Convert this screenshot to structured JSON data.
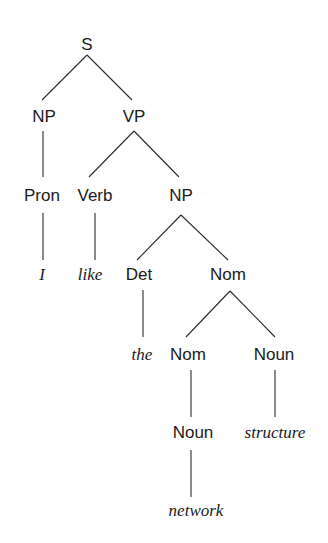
{
  "diagram": {
    "type": "parse-tree",
    "sentence": "I like the network structure",
    "nodes": [
      {
        "id": "S",
        "label": "S",
        "kind": "category",
        "x": 87,
        "y": 50
      },
      {
        "id": "NP1",
        "label": "NP",
        "kind": "category",
        "x": 44,
        "y": 122
      },
      {
        "id": "VP",
        "label": "VP",
        "kind": "category",
        "x": 134,
        "y": 122
      },
      {
        "id": "Pron",
        "label": "Pron",
        "kind": "category",
        "x": 42,
        "y": 201
      },
      {
        "id": "Verb",
        "label": "Verb",
        "kind": "category",
        "x": 95,
        "y": 201
      },
      {
        "id": "NP2",
        "label": "NP",
        "kind": "category",
        "x": 181,
        "y": 201
      },
      {
        "id": "I",
        "label": "I",
        "kind": "word",
        "x": 42,
        "y": 280
      },
      {
        "id": "like",
        "label": "like",
        "kind": "word",
        "x": 90,
        "y": 280
      },
      {
        "id": "Det",
        "label": "Det",
        "kind": "category",
        "x": 139,
        "y": 280
      },
      {
        "id": "Nom1",
        "label": "Nom",
        "kind": "category",
        "x": 228,
        "y": 280
      },
      {
        "id": "the",
        "label": "the",
        "kind": "word",
        "x": 142,
        "y": 360
      },
      {
        "id": "Nom2",
        "label": "Nom",
        "kind": "category",
        "x": 188,
        "y": 360
      },
      {
        "id": "Noun1",
        "label": "Noun",
        "kind": "category",
        "x": 274,
        "y": 360
      },
      {
        "id": "Noun2",
        "label": "Noun",
        "kind": "category",
        "x": 193,
        "y": 438
      },
      {
        "id": "structure",
        "label": "structure",
        "kind": "word",
        "x": 275,
        "y": 438
      },
      {
        "id": "network",
        "label": "network",
        "kind": "word",
        "x": 196,
        "y": 516
      }
    ],
    "edges": [
      {
        "from": "S",
        "to": "NP1",
        "x1": 87,
        "y1": 55,
        "x2": 42,
        "y2": 100
      },
      {
        "from": "S",
        "to": "VP",
        "x1": 87,
        "y1": 55,
        "x2": 132,
        "y2": 100
      },
      {
        "from": "NP1",
        "to": "Pron",
        "x1": 43,
        "y1": 131,
        "x2": 43,
        "y2": 177
      },
      {
        "from": "VP",
        "to": "Verb",
        "x1": 134,
        "y1": 131,
        "x2": 89,
        "y2": 177
      },
      {
        "from": "VP",
        "to": "NP2",
        "x1": 134,
        "y1": 131,
        "x2": 179,
        "y2": 177
      },
      {
        "from": "Pron",
        "to": "I",
        "x1": 43,
        "y1": 213,
        "x2": 43,
        "y2": 260
      },
      {
        "from": "Verb",
        "to": "like",
        "x1": 95,
        "y1": 213,
        "x2": 95,
        "y2": 260
      },
      {
        "from": "NP2",
        "to": "Det",
        "x1": 181,
        "y1": 215,
        "x2": 137,
        "y2": 260
      },
      {
        "from": "NP2",
        "to": "Nom1",
        "x1": 181,
        "y1": 215,
        "x2": 228,
        "y2": 260
      },
      {
        "from": "Det",
        "to": "the",
        "x1": 143,
        "y1": 290,
        "x2": 143,
        "y2": 337
      },
      {
        "from": "Nom1",
        "to": "Nom2",
        "x1": 230,
        "y1": 291,
        "x2": 186,
        "y2": 337
      },
      {
        "from": "Nom1",
        "to": "Noun1",
        "x1": 230,
        "y1": 291,
        "x2": 275,
        "y2": 337
      },
      {
        "from": "Nom2",
        "to": "Noun2",
        "x1": 191,
        "y1": 370,
        "x2": 191,
        "y2": 417
      },
      {
        "from": "Noun1",
        "to": "structure",
        "x1": 275,
        "y1": 370,
        "x2": 275,
        "y2": 417
      },
      {
        "from": "Noun2",
        "to": "network",
        "x1": 191,
        "y1": 450,
        "x2": 191,
        "y2": 497
      }
    ]
  }
}
